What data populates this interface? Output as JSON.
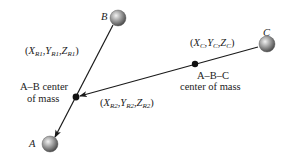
{
  "diagram": {
    "type": "molecular-coordinates",
    "nodes": [
      {
        "id": "A",
        "label": "A",
        "kind": "atom"
      },
      {
        "id": "B",
        "label": "B",
        "kind": "atom"
      },
      {
        "id": "C",
        "label": "C",
        "kind": "atom"
      },
      {
        "id": "AB_com",
        "label": "A–B center of mass",
        "kind": "center-of-mass"
      },
      {
        "id": "ABC_com",
        "label": "A–B–C center of mass",
        "kind": "center-of-mass"
      }
    ],
    "edges": [
      {
        "from": "B",
        "to": "A",
        "label": "(X_R1, Y_R1, Z_R1)",
        "arrow": true
      },
      {
        "from": "C",
        "to": "AB_com",
        "label": "(X_R2, Y_R2, Z_R2)",
        "arrow": true
      }
    ],
    "labels": {
      "atom_a": "A",
      "atom_b": "B",
      "atom_c": "C",
      "ab_center_line1": "A–B center",
      "ab_center_line2": "of mass",
      "abc_center_line1": "A–B–C",
      "abc_center_line2": "center of mass",
      "r1": {
        "x": "X",
        "y": "Y",
        "z": "Z",
        "sub": "R1"
      },
      "r2": {
        "x": "X",
        "y": "Y",
        "z": "Z",
        "sub": "R2"
      },
      "c_coord": {
        "x": "X",
        "y": "Y",
        "z": "Z",
        "sub": "C"
      }
    },
    "colors": {
      "line": "#1a1a1a",
      "sphere_light": "#d8d8d8",
      "sphere_dark": "#5a5a5a",
      "dot": "#111111"
    }
  }
}
